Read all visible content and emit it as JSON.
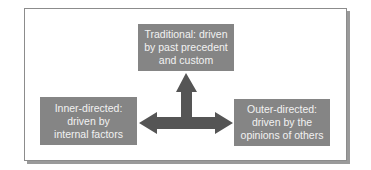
{
  "diagram": {
    "type": "directedness-model",
    "colors": {
      "box_fill": "#858585",
      "box_text": "#f2f2f2",
      "arrow_fill": "#555555",
      "frame_border": "#8c8c8c",
      "frame_shadow": "#9a9a9a"
    },
    "nodes": {
      "top": {
        "lines": [
          "Traditional: driven",
          "by past precedent",
          "and custom"
        ]
      },
      "left": {
        "lines": [
          "Inner-directed:",
          "driven by",
          "internal factors"
        ]
      },
      "right": {
        "lines": [
          "Outer-directed:",
          "driven by the",
          "opinions of others"
        ]
      }
    },
    "connectors": [
      {
        "from": "center",
        "to": "top",
        "style": "single-arrow"
      },
      {
        "from": "left",
        "to": "right",
        "style": "double-arrow"
      }
    ]
  }
}
